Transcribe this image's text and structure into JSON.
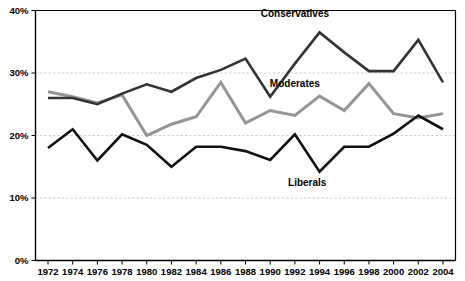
{
  "chart_data": {
    "type": "line",
    "title": "",
    "xlabel": "",
    "ylabel": "",
    "ylim": [
      0,
      40
    ],
    "ytick_labels": [
      "0%",
      "10%",
      "20%",
      "30%",
      "40%"
    ],
    "ytick_values": [
      0,
      10,
      20,
      30,
      40
    ],
    "grid": true,
    "gridlines_at": [
      10,
      20,
      30,
      40
    ],
    "legend_position": "inline-annotations",
    "categories": [
      1972,
      1974,
      1976,
      1978,
      1980,
      1982,
      1984,
      1986,
      1988,
      1990,
      1992,
      1994,
      1996,
      1998,
      2000,
      2002,
      2004
    ],
    "xtick_labels": [
      "1972",
      "1974",
      "1976",
      "1978",
      "1980",
      "1982",
      "1984",
      "1986",
      "1988",
      "1990",
      "1992",
      "1994",
      "1996",
      "1998",
      "2000",
      "2002",
      "2004"
    ],
    "series": [
      {
        "name": "Conservatives",
        "color": "#333333",
        "values": [
          26.0,
          26.0,
          25.0,
          26.7,
          28.2,
          27.0,
          29.2,
          30.5,
          32.3,
          26.2,
          31.5,
          36.5,
          33.3,
          30.3,
          30.3,
          35.3,
          28.5
        ]
      },
      {
        "name": "Moderates",
        "color": "#959595",
        "values": [
          27.0,
          26.2,
          25.2,
          26.5,
          20.0,
          21.8,
          23.0,
          28.5,
          22.0,
          24.0,
          23.2,
          26.3,
          24.0,
          28.3,
          23.5,
          22.8,
          23.5
        ]
      },
      {
        "name": "Liberals",
        "color": "#111111",
        "values": [
          18.0,
          21.0,
          16.0,
          20.2,
          18.5,
          15.0,
          18.2,
          18.2,
          17.5,
          16.1,
          20.2,
          14.2,
          18.2,
          18.2,
          20.3,
          23.2,
          21.0
        ]
      }
    ],
    "annotations": [
      {
        "text": "Conservatives",
        "series": "Conservatives",
        "x": 1992,
        "y": 39.0
      },
      {
        "text": "Moderates",
        "series": "Moderates",
        "x": 1992,
        "y": 27.7
      },
      {
        "text": "Liberals",
        "series": "Liberals",
        "x": 1993,
        "y": 12.0
      }
    ]
  }
}
